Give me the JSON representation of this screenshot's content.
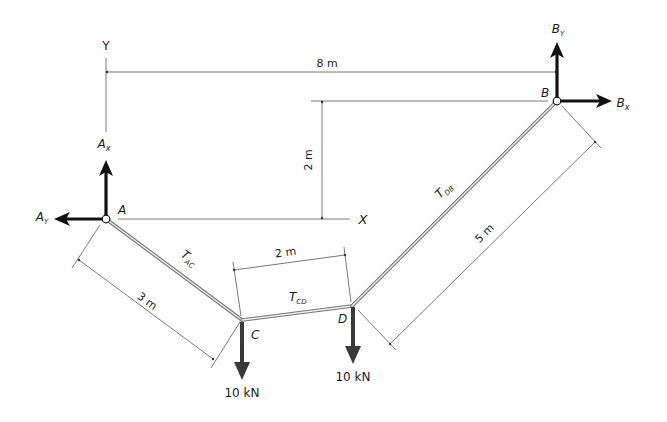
{
  "diagram": {
    "axes": {
      "y_label": "Y",
      "x_label": "X"
    },
    "points": {
      "A": {
        "label": "A"
      },
      "B": {
        "label": "B"
      },
      "C": {
        "label": "C"
      },
      "D": {
        "label": "D"
      }
    },
    "reactions": {
      "Ax": {
        "main": "A",
        "sub": "x"
      },
      "Ay": {
        "main": "A",
        "sub": "Y"
      },
      "Bx": {
        "main": "B",
        "sub": "x"
      },
      "By": {
        "main": "B",
        "sub": "Y"
      }
    },
    "tensions": {
      "AC": {
        "main": "T",
        "sub": "AC"
      },
      "CD": {
        "main": "T",
        "sub": "CD"
      },
      "DB": {
        "main": "T",
        "sub": "DB"
      }
    },
    "dimensions": {
      "horizontal_span": "8 m",
      "vertical_offset": "2 m",
      "segment_AC": "3 m",
      "segment_CD": "2 m",
      "segment_DB": "5 m"
    },
    "loads": {
      "C": "10 kN",
      "D": "10 kN"
    },
    "colors": {
      "line": "#555555",
      "force_arrow": "#111111",
      "load_arrow": "#3a3a3a",
      "cable": "#777777"
    }
  }
}
